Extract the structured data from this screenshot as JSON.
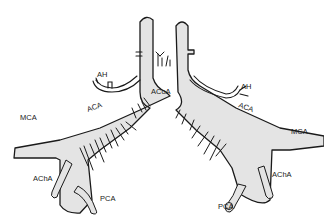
{
  "diagram": {
    "title": "",
    "style": "black-and-white anatomical line drawing",
    "colors": {
      "vessel_fill": "#e4e4e4",
      "stroke": "#1a1a1a",
      "background": "#ffffff"
    },
    "labels": {
      "ah_left": "AH",
      "ah_right": "AH",
      "acoa": "ACoA",
      "aca_left": "ACA",
      "aca_right": "ACA",
      "mca_left": "MCA",
      "mca_right": "MCA",
      "acha_left": "AChA",
      "acha_right": "AChA",
      "pca_left": "PCA",
      "pca_right": "PCA"
    }
  }
}
